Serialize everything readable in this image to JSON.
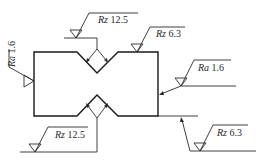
{
  "diagram": {
    "type": "surface-roughness-drawing",
    "annotations": [
      {
        "id": "top-notch",
        "param": "Rz",
        "value": "12.5"
      },
      {
        "id": "top-right",
        "param": "Rz",
        "value": "6.3"
      },
      {
        "id": "left-side",
        "param": "Ra",
        "value": "1.6"
      },
      {
        "id": "right-side",
        "param": "Ra",
        "value": "1.6"
      },
      {
        "id": "bottom-notch",
        "param": "Rz",
        "value": "12.5"
      },
      {
        "id": "bottom-right",
        "param": "Rz",
        "value": "6.3"
      }
    ]
  }
}
